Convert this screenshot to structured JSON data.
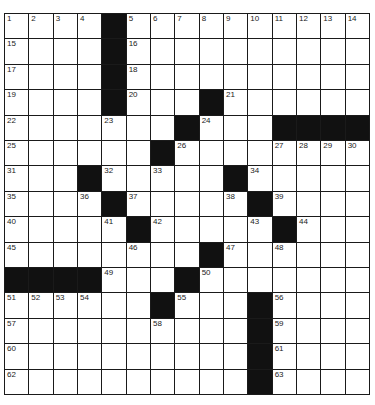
{
  "puzzle": {
    "rows": 15,
    "cols": 15,
    "colors": {
      "black": "#111111",
      "white": "#ffffff",
      "line": "#1a1a1a"
    },
    "grid": [
      [
        "1",
        "2",
        "3",
        "4",
        "#",
        "5",
        "6",
        "7",
        "8",
        "9",
        "10",
        "11",
        "12",
        "13",
        "14"
      ],
      [
        "15",
        "",
        "",
        "",
        "#",
        "16",
        "",
        "",
        "",
        "",
        "",
        "",
        "",
        "",
        ""
      ],
      [
        "17",
        "",
        "",
        "",
        "#",
        "18",
        "",
        "",
        "",
        "",
        "",
        "",
        "",
        "",
        ""
      ],
      [
        "19",
        "",
        "",
        "",
        "#",
        "20",
        "",
        "",
        "#",
        "21",
        "",
        "",
        "",
        "",
        ""
      ],
      [
        "22",
        "",
        "",
        "",
        "23",
        "",
        "",
        "#",
        "24",
        "",
        "",
        "#",
        "#",
        "#",
        "#"
      ],
      [
        "25",
        "",
        "",
        "",
        "",
        "",
        "#",
        "26",
        "",
        "",
        "",
        "27",
        "28",
        "29",
        "30"
      ],
      [
        "31",
        "",
        "",
        "#",
        "32",
        "",
        "33",
        "",
        "",
        "#",
        "34",
        "",
        "",
        "",
        ""
      ],
      [
        "35",
        "",
        "",
        "36",
        "#",
        "37",
        "",
        "",
        "",
        "38",
        "#",
        "39",
        "",
        "",
        ""
      ],
      [
        "40",
        "",
        "",
        "",
        "41",
        "#",
        "42",
        "",
        "",
        "",
        "43",
        "#",
        "44",
        "",
        ""
      ],
      [
        "45",
        "",
        "",
        "",
        "",
        "46",
        "",
        "",
        "#",
        "47",
        "",
        "48",
        "",
        "",
        ""
      ],
      [
        "#",
        "#",
        "#",
        "#",
        "49",
        "",
        "",
        "#",
        "50",
        "",
        "",
        "",
        "",
        "",
        ""
      ],
      [
        "51",
        "52",
        "53",
        "54",
        "",
        "",
        "#",
        "55",
        "",
        "",
        "#",
        "56",
        "",
        "",
        ""
      ],
      [
        "57",
        "",
        "",
        "",
        "",
        "",
        "58",
        "",
        "",
        "",
        "#",
        "59",
        "",
        "",
        ""
      ],
      [
        "60",
        "",
        "",
        "",
        "",
        "",
        "",
        "",
        "",
        "",
        "#",
        "61",
        "",
        "",
        ""
      ],
      [
        "62",
        "",
        "",
        "",
        "",
        "",
        "",
        "",
        "",
        "",
        "#",
        "63",
        "",
        "",
        ""
      ]
    ]
  }
}
